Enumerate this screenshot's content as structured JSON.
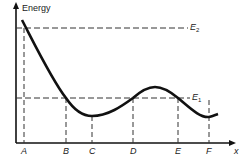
{
  "diagram": {
    "y_axis_label": "Energy",
    "x_axis_label": "x",
    "levels": [
      {
        "name": "E",
        "sub": "2",
        "y": 28
      },
      {
        "name": "E",
        "sub": "1",
        "y": 98
      }
    ],
    "points": [
      {
        "label": "A",
        "x": 24
      },
      {
        "label": "B",
        "x": 66
      },
      {
        "label": "C",
        "x": 92
      },
      {
        "label": "D",
        "x": 133
      },
      {
        "label": "E",
        "x": 178
      },
      {
        "label": "F",
        "x": 209
      }
    ],
    "curve_description": "Potential energy curve decreasing from above E2 at A, crossing E1 at B, minimum at C, rising through E1 at D, maximum between D and E, crossing E1 at E, falling to local minimum near F"
  }
}
